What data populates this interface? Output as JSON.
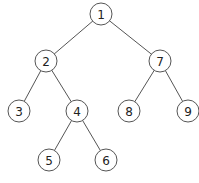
{
  "diagram": {
    "type": "binary-tree",
    "nodes": [
      {
        "id": "1",
        "label": "1",
        "x": 101,
        "y": 14
      },
      {
        "id": "2",
        "label": "2",
        "x": 46,
        "y": 61
      },
      {
        "id": "7",
        "label": "7",
        "x": 160,
        "y": 61
      },
      {
        "id": "3",
        "label": "3",
        "x": 19,
        "y": 111
      },
      {
        "id": "4",
        "label": "4",
        "x": 77,
        "y": 111
      },
      {
        "id": "8",
        "label": "8",
        "x": 129,
        "y": 111
      },
      {
        "id": "9",
        "label": "9",
        "x": 188,
        "y": 111
      },
      {
        "id": "5",
        "label": "5",
        "x": 49,
        "y": 160
      },
      {
        "id": "6",
        "label": "6",
        "x": 106,
        "y": 160
      }
    ],
    "edges": [
      {
        "from": "1",
        "to": "2"
      },
      {
        "from": "1",
        "to": "7"
      },
      {
        "from": "2",
        "to": "3"
      },
      {
        "from": "2",
        "to": "4"
      },
      {
        "from": "7",
        "to": "8"
      },
      {
        "from": "7",
        "to": "9"
      },
      {
        "from": "4",
        "to": "5"
      },
      {
        "from": "4",
        "to": "6"
      }
    ],
    "node_radius": 11
  }
}
